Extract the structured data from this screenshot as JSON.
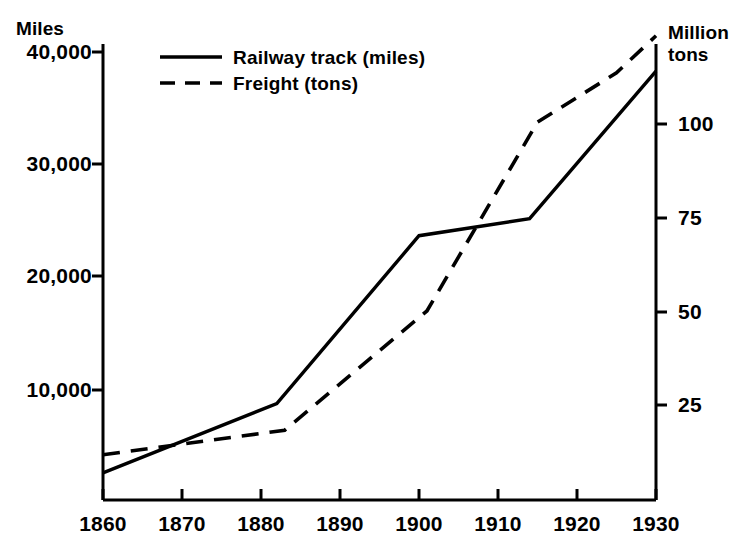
{
  "chart_data": {
    "type": "line",
    "title": "",
    "xlabel": "",
    "ylabel": "Miles",
    "y2label": "Million tons",
    "grid": false,
    "legend_position": "top-left-inside",
    "xlim": [
      1860,
      1930
    ],
    "ylim": [
      1200,
      41400
    ],
    "y2lim": [
      0,
      111
    ],
    "xticks": [
      1860,
      1870,
      1880,
      1890,
      1900,
      1910,
      1920,
      1930
    ],
    "xticklabels": [
      "1860",
      "1870",
      "1880",
      "1890",
      "1900",
      "1910",
      "1920",
      "1930"
    ],
    "yticks": [
      10000,
      20000,
      30000,
      40000
    ],
    "yticklabels": [
      "10,000",
      "20,000",
      "30,000",
      "40,000"
    ],
    "y2ticks": [
      25,
      50,
      75,
      100
    ],
    "y2ticklabels": [
      "25",
      "50",
      "75",
      "100"
    ],
    "series": [
      {
        "name": "Railway track (miles)",
        "axis": "left",
        "style": "solid",
        "x": [
          1860,
          1882,
          1900,
          1914,
          1930
        ],
        "values": [
          3600,
          9700,
          24500,
          26000,
          39000
        ]
      },
      {
        "name": "Freight (tons)",
        "axis": "right",
        "style": "dashed",
        "x": [
          1860,
          1883,
          1901,
          1915,
          1925,
          1930
        ],
        "values": [
          11,
          17,
          46,
          92,
          104,
          113
        ]
      }
    ]
  },
  "axes": {
    "left_title": "Miles",
    "right_title_line1": "Million",
    "right_title_line2": "tons"
  },
  "legend": {
    "items": [
      {
        "label": "Railway track (miles)",
        "style": "solid"
      },
      {
        "label": "Freight (tons)",
        "style": "dashed"
      }
    ]
  },
  "colors": {
    "line": "#000000",
    "axis": "#000000",
    "background": "#ffffff"
  }
}
